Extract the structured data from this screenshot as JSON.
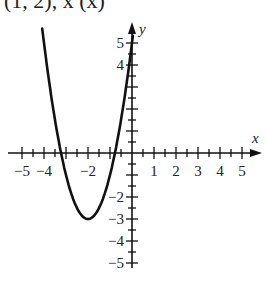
{
  "header_fragment": "(1, 2), x     (x)",
  "chart_data": {
    "type": "line",
    "title": "",
    "xlabel": "x",
    "ylabel": "y",
    "xlim": [
      -5,
      5
    ],
    "ylim": [
      -5,
      5
    ],
    "x_ticks": [
      -5,
      -4,
      -2,
      1,
      2,
      3,
      4,
      5
    ],
    "y_ticks": [
      5,
      4,
      -2,
      -3,
      -4,
      -5
    ],
    "minor_ticks_step": 0.5,
    "grid": false,
    "series": [
      {
        "name": "parabola",
        "equation": "y = 2(x+2)^2 - 3",
        "vertex": [
          -2,
          -3
        ],
        "x": [
          -4,
          -3.5,
          -3.22,
          -3,
          -2.5,
          -2,
          -1.5,
          -1,
          -0.78,
          -0.5,
          0
        ],
        "y": [
          5,
          1.5,
          0,
          -1,
          -2.5,
          -3,
          -2.5,
          -1,
          0,
          1.5,
          5
        ]
      }
    ]
  },
  "axis": {
    "x_name": "x",
    "y_name": "y"
  },
  "labels": {
    "xm5": "−5",
    "xm4": "−4",
    "xm2": "−2",
    "x1": "1",
    "x2": "2",
    "x3": "3",
    "x4": "4",
    "x5": "5",
    "y5": "5",
    "y4": "4",
    "ym2": "−2",
    "ym3": "−3",
    "ym4": "−4",
    "ym5": "−5"
  }
}
